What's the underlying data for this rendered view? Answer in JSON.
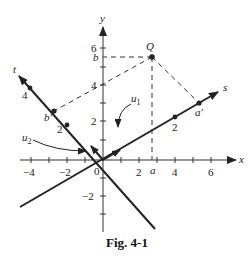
{
  "figure": {
    "caption": "Fig. 4-1",
    "axes": {
      "x_label": "x",
      "y_label": "y",
      "s_label": "s",
      "t_label": "t",
      "origin_label": "0"
    },
    "x_ticks": [
      {
        "value": -4,
        "label": "−4"
      },
      {
        "value": -2,
        "label": "−2"
      },
      {
        "value": 2,
        "label": "2"
      },
      {
        "value": 4,
        "label": "4"
      },
      {
        "value": 6,
        "label": "6"
      }
    ],
    "y_ticks": [
      {
        "value": 6,
        "label": "6"
      },
      {
        "value": 4,
        "label": "4"
      },
      {
        "value": 2,
        "label": "2"
      },
      {
        "value": -2,
        "label": "−2"
      }
    ],
    "s_ticks": [
      {
        "label": "2"
      }
    ],
    "t_ticks": [
      {
        "label": "2"
      },
      {
        "label": "4"
      }
    ],
    "points": {
      "Q": "Q",
      "a": "a",
      "b": "b",
      "a_prime": "a′",
      "b_prime": "b′"
    },
    "vectors": {
      "u1": "u",
      "u1_sub": "1",
      "u2": "u",
      "u2_sub": "2"
    }
  }
}
